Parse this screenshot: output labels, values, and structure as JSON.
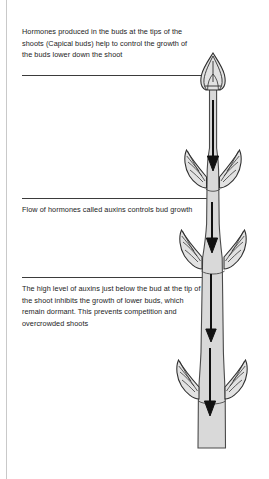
{
  "page": {
    "background_color": "#ffffff",
    "rule_color": "#c9c9c9",
    "text_color": "#1c1c1c"
  },
  "annotations": [
    {
      "id": "apical-bud-note",
      "text": "Hormones produced in the buds at the tips of the shoots (Capical buds) help to control the growth of the buds lower down the shoot"
    },
    {
      "id": "auxin-flow-note",
      "text": "Flow of hormones called auxins controls bud growth"
    },
    {
      "id": "dormancy-note",
      "text": "The high level of auxins just below the bud at the tip of the shoot inhibits the growth of lower buds, which remain dormant. This prevents competition and overcrowded shoots"
    }
  ],
  "diagram": {
    "stem_fill": "#d9d9d9",
    "stem_outline": "#4a4a4a",
    "bud_fill": "#e2e2e2",
    "bud_outline": "#2e2e2e",
    "arrow_color": "#111111",
    "apical_bud_label": "apical bud",
    "lateral_bud_pairs": 3,
    "arrow_count": 4,
    "arrow_direction": "down"
  }
}
